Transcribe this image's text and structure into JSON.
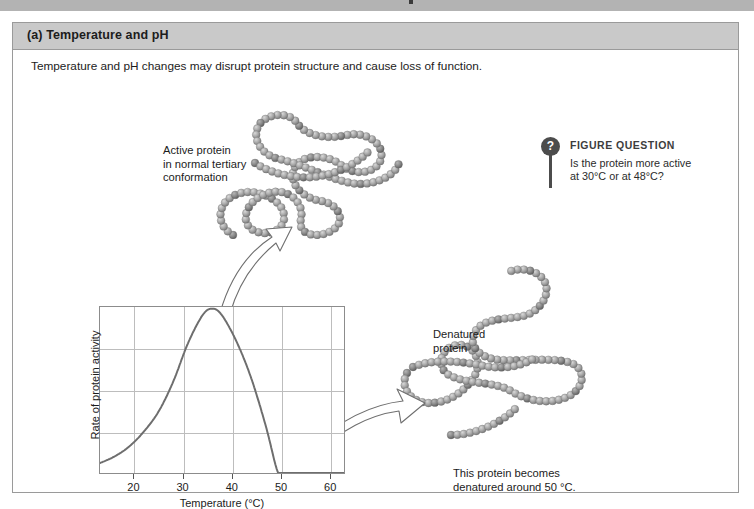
{
  "panel": {
    "header_label": "(a) Temperature and pH",
    "subtitle": "Temperature and pH changes may disrupt protein structure and cause loss of function."
  },
  "figure_question": {
    "badge_glyph": "?",
    "title": "FIGURE QUESTION",
    "line1": "Is the protein more active",
    "line2": "at 30°C or at 48°C?"
  },
  "annotations": {
    "active_protein": {
      "line1": "Active protein",
      "line2": "in normal tertiary",
      "line3": "conformation"
    },
    "denatured_protein": {
      "line1": "Denatured",
      "line2": "protein"
    },
    "caption": {
      "line1": "This protein becomes",
      "line2": "denatured around 50 °C."
    }
  },
  "colors": {
    "panel_header_bg": "#c9c9c9",
    "panel_border": "#9a9a9a",
    "top_band": "#b3b3b3",
    "curve": "#6e6e6e",
    "grid": "#bdbdbd",
    "axis": "#8c8c8c",
    "bead_light": "#b9b9b9",
    "bead_dark": "#6a6a6a",
    "badge": "#4c4c4c"
  },
  "chart_data": {
    "type": "line",
    "title": "",
    "xlabel": "Temperature (°C)",
    "ylabel": "Rate of protein activity",
    "xlim": [
      13,
      63
    ],
    "ylim": [
      0,
      1
    ],
    "xticks": [
      20,
      30,
      40,
      50,
      60
    ],
    "xtick_labels": [
      "20",
      "30",
      "40",
      "50",
      "60"
    ],
    "yticks": [],
    "ytick_labels": [],
    "grid": "both",
    "hgridlines": 3,
    "vgridlines": 5,
    "legend": "none",
    "series": [
      {
        "name": "Rate of protein activity",
        "x": [
          13,
          16,
          19,
          22,
          25,
          28,
          31,
          34,
          36,
          38,
          41,
          44,
          47,
          49.5,
          51,
          55,
          60,
          63
        ],
        "y": [
          0.06,
          0.1,
          0.16,
          0.25,
          0.37,
          0.55,
          0.78,
          0.95,
          0.99,
          0.95,
          0.79,
          0.57,
          0.28,
          0.0,
          0.0,
          0.0,
          0.0,
          0.0
        ]
      }
    ],
    "annotations": [
      {
        "text": "peak near 36 °C"
      },
      {
        "text": "activity falls to zero near 50 °C"
      }
    ]
  }
}
